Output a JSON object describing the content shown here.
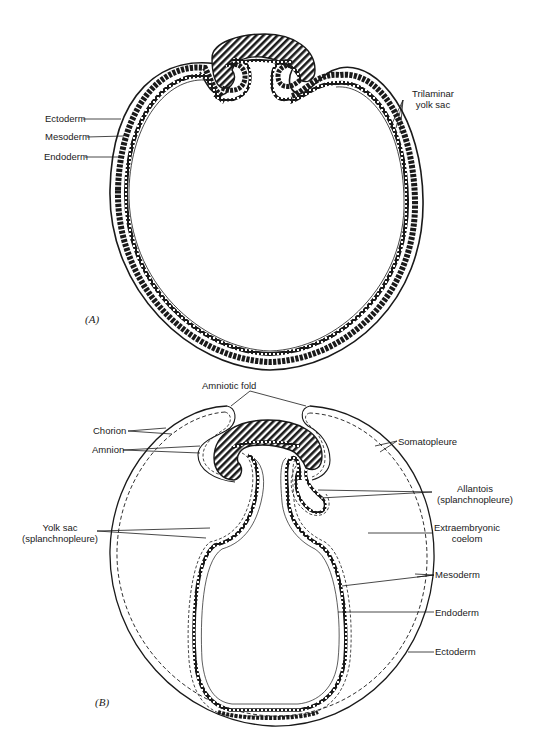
{
  "figure": {
    "panel_a": {
      "label": "(A)",
      "labels": {
        "ectoderm": "Ectoderm",
        "mesoderm": "Mesoderm",
        "endoderm": "Endoderm",
        "trilaminar_1": "Trilaminar",
        "trilaminar_2": "yolk sac"
      }
    },
    "panel_b": {
      "label": "(B)",
      "labels": {
        "amniotic_fold": "Amniotic fold",
        "chorion": "Chorion",
        "amnion": "Amnion",
        "somatopleure": "Somatopleure",
        "allantois_1": "Allantois",
        "allantois_2": "(splanchnopleure)",
        "yolk_sac_1": "Yolk sac",
        "yolk_sac_2": "(splanchnopleure)",
        "extraembryonic_1": "Extraembryonic",
        "extraembryonic_2": "coelom",
        "mesoderm": "Mesoderm",
        "endoderm": "Endoderm",
        "ectoderm": "Ectoderm"
      }
    },
    "colors": {
      "ink": "#1a1a1a",
      "paper": "#ffffff"
    }
  }
}
